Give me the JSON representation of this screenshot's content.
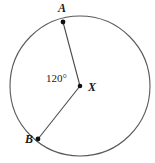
{
  "figure": {
    "type": "circle-with-central-angle",
    "background_color": "#ffffff",
    "stroke_color": "#595959",
    "point_color": "#111111",
    "text_color": "#1a1a1a",
    "circle": {
      "center_x": 80,
      "center_y": 86,
      "radius": 70,
      "stroke_width": 1.1
    },
    "center_point": {
      "label": "X",
      "x": 80,
      "y": 86,
      "dot_radius": 2.3
    },
    "points": [
      {
        "label": "A",
        "x": 63,
        "y": 22,
        "dot_radius": 2.4
      },
      {
        "label": "B",
        "x": 38,
        "y": 139,
        "dot_radius": 2.4
      }
    ],
    "radii": [
      {
        "name": "radius-XA",
        "x1": 80,
        "y1": 86,
        "x2": 63,
        "y2": 22
      },
      {
        "name": "radius-XB",
        "x1": 80,
        "y1": 86,
        "x2": 38,
        "y2": 139
      }
    ],
    "angle": {
      "label": "120°",
      "value": 120,
      "unit": "degrees",
      "vertex": "X",
      "rays": [
        "A",
        "B"
      ]
    }
  }
}
